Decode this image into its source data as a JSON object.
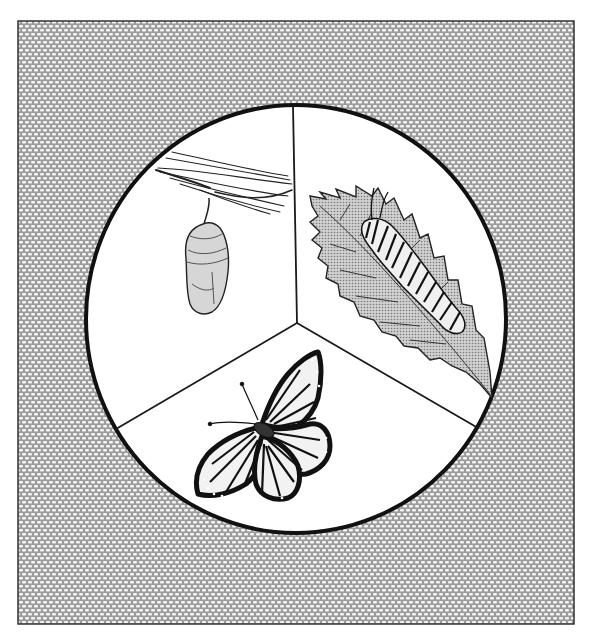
{
  "figure": {
    "frame": {
      "x": 18,
      "y": 21,
      "width": 556,
      "height": 603,
      "border_color": "#333333"
    },
    "texture": {
      "background": "#9c9c9c",
      "cell_color": "#f4f4f4"
    },
    "circle": {
      "cx": 296,
      "cy": 319,
      "rx": 210,
      "ry": 214,
      "stroke": "#111111",
      "stroke_width": 4
    },
    "dividers": {
      "junction": {
        "x": 297,
        "y": 323
      },
      "top": {
        "x": 293,
        "y": 106
      },
      "left": {
        "x": 116,
        "y": 429
      },
      "right": {
        "x": 478,
        "y": 428
      },
      "stroke": "#1a1a1a"
    },
    "sections": [
      {
        "id": "pupa",
        "label": "Chrysalis",
        "position": "upper-left"
      },
      {
        "id": "larva",
        "label": "Caterpillar on leaf",
        "position": "upper-right"
      },
      {
        "id": "adult",
        "label": "Butterfly",
        "position": "bottom"
      }
    ],
    "colors": {
      "ink": "#111111",
      "leaf_fill": "#b8b8b8",
      "chrysalis_fill": "#d6d6d6",
      "wing_fill": "#f2f2f2"
    }
  },
  "caption": {
    "text": ""
  }
}
